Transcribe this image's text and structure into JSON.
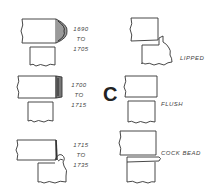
{
  "diagram": {
    "section_letter": "C",
    "left_column": [
      {
        "from": "1690",
        "to_word": "TO",
        "until": "1705"
      },
      {
        "from": "1700",
        "to_word": "TO",
        "until": "1715"
      },
      {
        "from": "1715",
        "to_word": "TO",
        "until": "1735"
      }
    ],
    "right_column": [
      {
        "label": "LIPPED"
      },
      {
        "label": "FLUSH"
      },
      {
        "label": "COCK BEAD"
      }
    ]
  }
}
